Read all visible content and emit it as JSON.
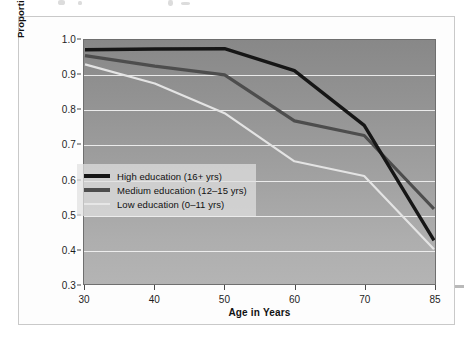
{
  "chart_data": {
    "type": "line",
    "title": "",
    "xlabel": "Age in Years",
    "ylabel": "Proportion with No Health Limitations in Daily Activities",
    "ylabel_line1": "Proportion with No Health Limitations",
    "ylabel_line2": "in Daily Activities",
    "x": [
      30,
      40,
      50,
      60,
      70,
      85
    ],
    "xtick_labels": [
      "30",
      "40",
      "50",
      "60",
      "70",
      "85"
    ],
    "ytick_labels": [
      "1.0",
      "0.9",
      "0.8",
      "0.7",
      "0.6",
      "0.5",
      "0.4",
      "0.3"
    ],
    "ylim": [
      0.3,
      1.0
    ],
    "ytick_values": [
      1.0,
      0.9,
      0.8,
      0.7,
      0.6,
      0.5,
      0.4,
      0.3
    ],
    "grid": true,
    "grid_axis": "y",
    "legend_position": "lower-left",
    "x_spacing": "categorical",
    "series": [
      {
        "name": "High education (16+ yrs)",
        "color": "#161616",
        "width": 3.4,
        "values": [
          0.972,
          0.974,
          0.975,
          0.912,
          0.755,
          0.425
        ]
      },
      {
        "name": "Medium education (12–15 yrs)",
        "color": "#4d4d4d",
        "width": 3.2,
        "values": [
          0.955,
          0.925,
          0.9,
          0.768,
          0.726,
          0.515
        ]
      },
      {
        "name": "Low education (0–11 yrs)",
        "color": "#e4e4e4",
        "width": 2.2,
        "values": [
          0.93,
          0.875,
          0.79,
          0.652,
          0.61,
          0.4
        ]
      }
    ]
  },
  "legend": {
    "items": [
      {
        "label": "High education (16+ yrs)",
        "color": "#161616",
        "thickness": "4px"
      },
      {
        "label": "Medium education (12–15 yrs)",
        "color": "#4d4d4d",
        "thickness": "4px"
      },
      {
        "label": "Low education (0–11 yrs)",
        "color": "#e6e6e6",
        "thickness": "2px"
      }
    ]
  },
  "colors": {
    "panel_background": "#fdfdfd",
    "panel_border": "#c9c9c9",
    "plot_top": "#888888",
    "plot_bottom": "#b4b4b4",
    "gridline": "#f2f2f2",
    "axis_text": "#1d1d1d"
  }
}
